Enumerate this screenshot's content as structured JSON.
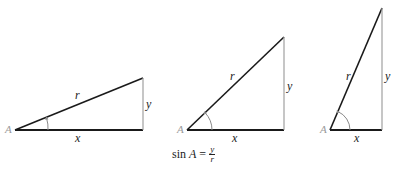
{
  "diagram": {
    "colors": {
      "hypotenuse": "#1a1a1a",
      "base": "#1a1a1a",
      "vertical": "#a0a0a0",
      "angle_arc": "#8a8a8a",
      "vertex_label": "#9a9a9a"
    },
    "triangles": [
      {
        "id": "shallow",
        "vertex_label": "A",
        "hypotenuse_label": "r",
        "opposite_label": "y",
        "adjacent_label": "x",
        "points": {
          "A": [
            15,
            130
          ],
          "C": [
            143,
            130
          ],
          "B": [
            143,
            78
          ]
        }
      },
      {
        "id": "medium",
        "vertex_label": "A",
        "hypotenuse_label": "r",
        "opposite_label": "y",
        "adjacent_label": "x",
        "points": {
          "A": [
            187,
            130
          ],
          "C": [
            284,
            130
          ],
          "B": [
            284,
            37
          ]
        }
      },
      {
        "id": "steep",
        "vertex_label": "A",
        "hypotenuse_label": "r",
        "opposite_label": "y",
        "adjacent_label": "x",
        "points": {
          "A": [
            330,
            130
          ],
          "C": [
            382,
            130
          ],
          "B": [
            382,
            8
          ]
        }
      }
    ],
    "formula": {
      "func": "sin",
      "var": "A",
      "equals": "=",
      "numerator": "y",
      "denominator": "r"
    }
  }
}
